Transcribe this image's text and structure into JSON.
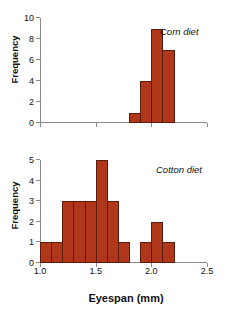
{
  "figure": {
    "background": "#ffffff",
    "bar_color": "#B0371A",
    "bar_edge_color": "#5d1b0c",
    "axis_color": "#8a8a8a",
    "xlabel": "Eyespan (mm)"
  },
  "chart_data": [
    {
      "type": "bar",
      "title": "Corn diet",
      "panel_label": "Corn diet",
      "xlabel": "",
      "ylabel": "Frequency",
      "xlim": [
        1.0,
        2.5
      ],
      "ylim": [
        0,
        10
      ],
      "grid": false,
      "legend": "none",
      "xticks": [
        1.0,
        1.5,
        2.0,
        2.5
      ],
      "xticklabels": [
        "",
        "",
        "",
        ""
      ],
      "yticks": [
        0,
        2,
        4,
        6,
        8,
        10
      ],
      "yticklabels": [
        "0",
        "2",
        "4",
        "6",
        "8",
        "10"
      ],
      "bin_width": 0.1,
      "bins": [
        {
          "left": 1.8,
          "right": 1.9,
          "value": 1
        },
        {
          "left": 1.9,
          "right": 2.0,
          "value": 4
        },
        {
          "left": 2.0,
          "right": 2.1,
          "value": 9
        },
        {
          "left": 2.1,
          "right": 2.2,
          "value": 7
        }
      ],
      "categories": [
        "1.8-1.9",
        "1.9-2.0",
        "2.0-2.1",
        "2.1-2.2"
      ],
      "values": [
        1,
        4,
        9,
        7
      ]
    },
    {
      "type": "bar",
      "title": "Cotton diet",
      "panel_label": "Cotton diet",
      "xlabel": "Eyespan (mm)",
      "ylabel": "Frequency",
      "xlim": [
        1.0,
        2.5
      ],
      "ylim": [
        0,
        5
      ],
      "grid": false,
      "legend": "none",
      "xticks": [
        1.0,
        1.5,
        2.0,
        2.5
      ],
      "xticklabels": [
        "1.0",
        "1.5",
        "2.0",
        "2.5"
      ],
      "yticks": [
        0,
        1,
        2,
        3,
        4,
        5
      ],
      "yticklabels": [
        "0",
        "1",
        "2",
        "3",
        "4",
        "5"
      ],
      "bin_width": 0.1,
      "bins": [
        {
          "left": 1.0,
          "right": 1.1,
          "value": 1
        },
        {
          "left": 1.1,
          "right": 1.2,
          "value": 1
        },
        {
          "left": 1.2,
          "right": 1.3,
          "value": 3
        },
        {
          "left": 1.3,
          "right": 1.4,
          "value": 3
        },
        {
          "left": 1.4,
          "right": 1.5,
          "value": 3
        },
        {
          "left": 1.5,
          "right": 1.6,
          "value": 5
        },
        {
          "left": 1.6,
          "right": 1.7,
          "value": 3
        },
        {
          "left": 1.7,
          "right": 1.8,
          "value": 1
        },
        {
          "left": 1.8,
          "right": 1.9,
          "value": 0
        },
        {
          "left": 1.9,
          "right": 2.0,
          "value": 1
        },
        {
          "left": 2.0,
          "right": 2.1,
          "value": 2
        },
        {
          "left": 2.1,
          "right": 2.2,
          "value": 1
        }
      ],
      "categories": [
        "1.0-1.1",
        "1.1-1.2",
        "1.2-1.3",
        "1.3-1.4",
        "1.4-1.5",
        "1.5-1.6",
        "1.6-1.7",
        "1.7-1.8",
        "1.8-1.9",
        "1.9-2.0",
        "2.0-2.1",
        "2.1-2.2"
      ],
      "values": [
        1,
        1,
        3,
        3,
        3,
        5,
        3,
        1,
        0,
        1,
        2,
        1
      ]
    }
  ]
}
